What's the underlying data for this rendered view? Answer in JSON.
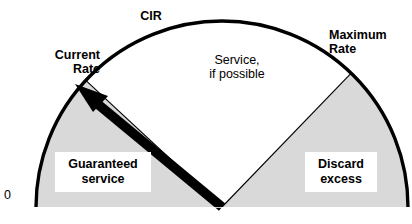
{
  "diagram": {
    "type": "gauge-sector-diagram",
    "title_visible": false,
    "center": {
      "x": 222,
      "y": 207
    },
    "radius": 186,
    "colors": {
      "shaded_sector": "#d9d9d9",
      "open_sector": "#ffffff",
      "outline": "#000000",
      "needle": "#000000",
      "label_box": "#ffffff",
      "page_background": "#ffffff"
    },
    "labels": {
      "zero": "0",
      "current_rate": "Current\nRate",
      "cir": "CIR",
      "maximum_rate": "Maximum\nRate",
      "service_if_possible": "Service,\nif possible",
      "guaranteed_service": "Guaranteed\nservice",
      "discard_excess": "Discard\nexcess"
    },
    "sectors": [
      {
        "name": "guaranteed-service",
        "label": "Guaranteed\nservice",
        "fill": "#d9d9d9",
        "start_angle_deg": 180,
        "end_angle_deg": 137
      },
      {
        "name": "service-if-possible",
        "label": "Service,\nif possible",
        "fill": "#ffffff",
        "start_angle_deg": 137,
        "end_angle_deg": 46
      },
      {
        "name": "discard-excess",
        "label": "Discard\nexcess",
        "fill": "#d9d9d9",
        "start_angle_deg": 46,
        "end_angle_deg": 0
      }
    ],
    "tick_marks": [
      {
        "name": "zero-mark",
        "label": "0",
        "angle_deg": 180
      },
      {
        "name": "current-rate-mark",
        "label": "Current\nRate",
        "angle_deg": 140
      },
      {
        "name": "cir-mark",
        "label": "CIR",
        "angle_deg": 137
      },
      {
        "name": "maximum-rate-mark",
        "label": "Maximum\nRate",
        "angle_deg": 46
      }
    ],
    "needle": {
      "name": "current-rate-needle",
      "label": "Current Rate",
      "angle_deg": 140,
      "tip": {
        "x": 76,
        "y": 85
      }
    }
  }
}
